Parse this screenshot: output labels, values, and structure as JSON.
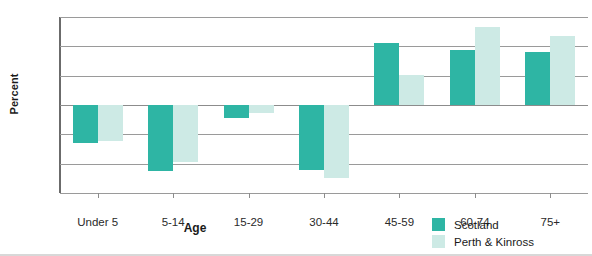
{
  "chart_data": {
    "type": "bar",
    "title": "",
    "xlabel": "Age",
    "ylabel": "Percent",
    "categories": [
      "Under 5",
      "5-14",
      "15-29",
      "30-44",
      "45-59",
      "60-74",
      "75+"
    ],
    "series": [
      {
        "name": "Scotland",
        "color": "#2eb5a4",
        "values": [
          -12.8,
          -22.5,
          -4.5,
          -22.3,
          21.0,
          18.8,
          18.2
        ]
      },
      {
        "name": "Perth & Kinross",
        "color": "#cdeae5",
        "values": [
          -12.3,
          -19.5,
          -2.7,
          -25.0,
          10.2,
          26.5,
          23.5
        ]
      }
    ],
    "ylim": [
      -30,
      30
    ],
    "ytick_labels": [
      "30",
      "20",
      "10",
      "0",
      "-10",
      "-20",
      "-30"
    ],
    "ytick_values": [
      30,
      20,
      10,
      0,
      -10,
      -20,
      -30
    ],
    "grid": true,
    "legend_position": "bottom-right"
  },
  "axes": {
    "y_title": "Percent",
    "x_title": "Age"
  },
  "legend": {
    "items": [
      {
        "label": "Scotland"
      },
      {
        "label": "Perth & Kinross"
      }
    ]
  },
  "colors": {
    "scotland": "#2eb5a4",
    "perth_kinross": "#cdeae5",
    "gridline": "#9a9a9a",
    "axis": "#6b6b6b",
    "text": "#1a1a1a"
  }
}
